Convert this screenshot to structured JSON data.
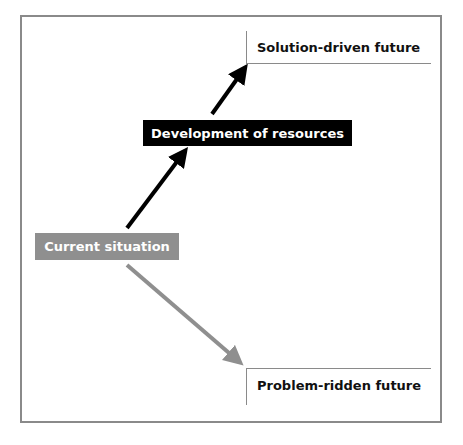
{
  "diagram": {
    "nodes": {
      "solution_future": "Solution-driven future",
      "development": "Development of resources",
      "current": "Current situation",
      "problem_future": "Problem-ridden future"
    },
    "colors": {
      "frame": "#8a8a8a",
      "development_box": "#000000",
      "current_box": "#8f8f8f",
      "black_arrow": "#000000",
      "gray_arrow": "#8f8f8f"
    },
    "edges": [
      {
        "from": "current",
        "to": "development",
        "color": "black"
      },
      {
        "from": "development",
        "to": "solution_future",
        "color": "black"
      },
      {
        "from": "current",
        "to": "problem_future",
        "color": "gray"
      }
    ]
  }
}
